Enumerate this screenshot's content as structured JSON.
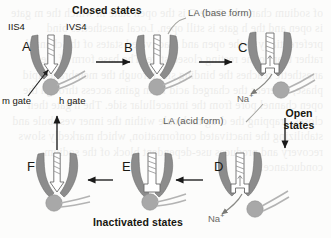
{
  "figure": {
    "title_closed": "Closed states",
    "title_open": "Open states",
    "title_inactivated": "Inactivated states",
    "label_iis4": "IIS4",
    "label_ivs4": "IVS4",
    "label_m_gate": "m gate",
    "label_h_gate": "h gate",
    "label_la_base": "LA (base form)",
    "label_la_acid": "LA (acid form)",
    "ion_sodium": "Na",
    "ion_sodium_charge": "+",
    "colors": {
      "helix": "#8c8c8c",
      "helix_dark": "#6f6f6f",
      "ball": "#a8a8a8",
      "outline": "#555555",
      "arrow": "#1a1a1a",
      "gray_text": "#5b5b57",
      "black_text": "#17160f"
    }
  },
  "panels": [
    {
      "id": "A",
      "letter": "A",
      "state": "closed",
      "name": "panel-a-closed-resting"
    },
    {
      "id": "B",
      "letter": "B",
      "state": "closed",
      "name": "panel-b-closed"
    },
    {
      "id": "C",
      "letter": "C",
      "state": "open",
      "name": "panel-c-open"
    },
    {
      "id": "D",
      "letter": "D",
      "state": "open",
      "name": "panel-d-open"
    },
    {
      "id": "E",
      "letter": "E",
      "state": "inactivated",
      "name": "panel-e-inactivated"
    },
    {
      "id": "F",
      "letter": "F",
      "state": "inactivated",
      "name": "panel-f-inactivated"
    }
  ],
  "bleed_text": "of sodium channels. State C is the open state in which the m gate is open and the h gate is still open. Local anesthetics bind preferentially to the open and inactivated states of the channel rather than to the resting closed state. The base form of the anesthetic reaches the binding site through the membrane lipid phase, whereas the charged acid form gains access through the open channel pore from the intracellular side. The h gate then closes, trapping the drug molecule within the inner vestibule and stabilizing the inactivated conformation, which markedly slows recovery and produces use-dependent block of the sodium conductance."
}
